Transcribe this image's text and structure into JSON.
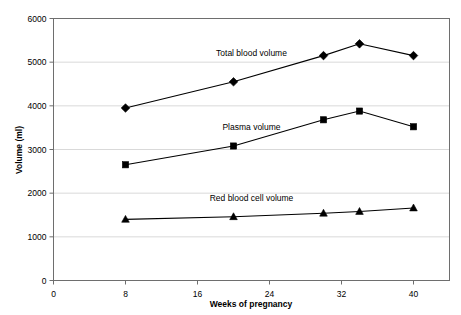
{
  "chart_data": {
    "type": "line",
    "title": "",
    "xlabel": "Weeks of pregnancy",
    "ylabel": "Volume (ml)",
    "xlim": [
      0,
      44
    ],
    "ylim": [
      0,
      6000
    ],
    "xticks": [
      0,
      8,
      16,
      24,
      32,
      40
    ],
    "yticks": [
      0,
      1000,
      2000,
      3000,
      4000,
      5000,
      6000
    ],
    "xtick_labels": [
      "0",
      "8",
      "16",
      "24",
      "32",
      "40"
    ],
    "ytick_labels": [
      "0",
      "1000",
      "2000",
      "3000",
      "4000",
      "5000",
      "6000"
    ],
    "grid": true,
    "grid_axis": "y",
    "legend_position": "inline-annotations",
    "series": [
      {
        "name": "Total blood volume",
        "marker": "diamond",
        "color": "#000000",
        "label_x": 22,
        "label_y": 5150,
        "x": [
          8,
          20,
          30,
          34,
          40
        ],
        "values": [
          3950,
          4550,
          5150,
          5420,
          5150
        ]
      },
      {
        "name": "Plasma volume",
        "marker": "square",
        "color": "#000000",
        "label_x": 22,
        "label_y": 3450,
        "x": [
          8,
          20,
          30,
          34,
          40
        ],
        "values": [
          2650,
          3080,
          3680,
          3880,
          3520
        ]
      },
      {
        "name": "Red blood cell volume",
        "marker": "triangle",
        "color": "#000000",
        "label_x": 22,
        "label_y": 1820,
        "x": [
          8,
          20,
          30,
          34,
          40
        ],
        "values": [
          1400,
          1460,
          1540,
          1580,
          1660
        ]
      }
    ]
  }
}
